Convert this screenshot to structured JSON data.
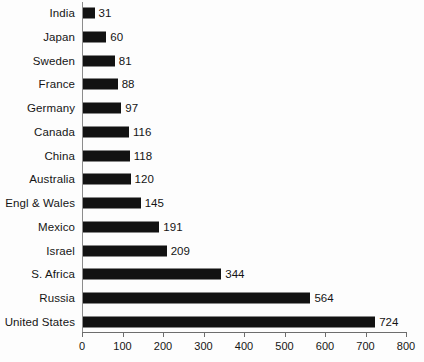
{
  "chart_data": {
    "type": "bar",
    "orientation": "horizontal",
    "title": "",
    "xlabel": "",
    "ylabel": "",
    "xlim": [
      0,
      800
    ],
    "xticks": [
      0,
      100,
      200,
      300,
      400,
      500,
      600,
      700,
      800
    ],
    "grid": false,
    "legend": false,
    "bar_color": "#121212",
    "axis_color": "#6d6d6d",
    "background": "#fdfdfd",
    "categories": [
      "India",
      "Japan",
      "Sweden",
      "France",
      "Germany",
      "Canada",
      "China",
      "Australia",
      "Engl & Wales",
      "Mexico",
      "Israel",
      "S. Africa",
      "Russia",
      "United States"
    ],
    "values": [
      31,
      60,
      81,
      88,
      97,
      116,
      118,
      120,
      145,
      191,
      209,
      344,
      564,
      724
    ],
    "data_labels": [
      "31",
      "60",
      "81",
      "88",
      "97",
      "116",
      "118",
      "120",
      "145",
      "191",
      "209",
      "344",
      "564",
      "724"
    ],
    "tick_labels": [
      "0",
      "100",
      "200",
      "300",
      "400",
      "500",
      "600",
      "700",
      "800"
    ]
  }
}
